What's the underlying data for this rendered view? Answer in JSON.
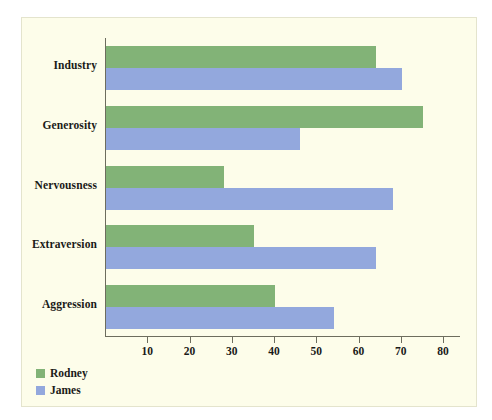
{
  "chart_data": {
    "type": "bar",
    "orientation": "horizontal",
    "title": "",
    "xlabel": "",
    "ylabel": "",
    "categories": [
      "Industry",
      "Generosity",
      "Nervousness",
      "Extraversion",
      "Aggression"
    ],
    "series": [
      {
        "name": "Rodney",
        "color": "#82b377",
        "values": [
          64,
          75,
          28,
          35,
          40
        ]
      },
      {
        "name": "James",
        "color": "#93a8dd",
        "values": [
          70,
          46,
          68,
          64,
          54
        ]
      }
    ],
    "xlim": [
      0,
      84
    ],
    "xticks": [
      10,
      20,
      30,
      40,
      50,
      60,
      70,
      80
    ],
    "xtick_labels": [
      "10",
      "20",
      "30",
      "40",
      "50",
      "60",
      "70",
      "80"
    ],
    "grid": false,
    "legend_position": "bottom-left"
  },
  "style": {
    "panel_background": "#fdfdea",
    "page_background": "#ffffff",
    "axis_color": "#6d6d5e",
    "text_color": "#1a1a18"
  }
}
